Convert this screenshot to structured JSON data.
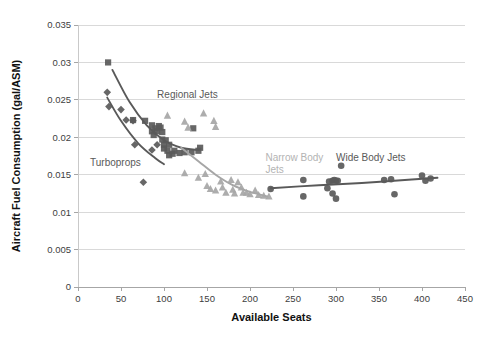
{
  "chart_data": {
    "type": "scatter",
    "title": "",
    "xlabel": "Available Seats",
    "ylabel": "Aircraft Fuel Consumption (gal/ASM)",
    "xlim": [
      0,
      450
    ],
    "ylim": [
      0,
      0.035
    ],
    "xticks": [
      "0",
      "50",
      "100",
      "150",
      "200",
      "250",
      "300",
      "350",
      "400",
      "450"
    ],
    "yticks": [
      "0",
      "0.005",
      "0.01",
      "0.015",
      "0.02",
      "0.025",
      "0.03",
      "0.035"
    ],
    "grid": "horizontal",
    "legend_position": "inline-annotations",
    "annotations": [
      {
        "text": "Regional Jets",
        "x": 92,
        "y": 0.0253,
        "color": "#595959"
      },
      {
        "text": "Turboprops",
        "x": 14,
        "y": 0.0161,
        "color": "#595959"
      },
      {
        "text": "Narrow Body",
        "x": 218,
        "y": 0.0168,
        "color": "#b3b3b3"
      },
      {
        "text": "Jets",
        "x": 218,
        "y": 0.0152,
        "color": "#b3b3b3"
      },
      {
        "text": "Wide Body Jets",
        "x": 300,
        "y": 0.0168,
        "color": "#595959"
      }
    ],
    "series": [
      {
        "name": "Turboprops",
        "marker": "diamond",
        "color": "#5a5a5a",
        "points": [
          [
            34,
            0.026
          ],
          [
            36,
            0.0241
          ],
          [
            50,
            0.0237
          ],
          [
            56,
            0.0223
          ],
          [
            64,
            0.0222
          ],
          [
            66,
            0.019
          ],
          [
            86,
            0.0183
          ],
          [
            92,
            0.019
          ],
          [
            76,
            0.014
          ]
        ],
        "trend": [
          [
            34,
            0.0253
          ],
          [
            50,
            0.0222
          ],
          [
            70,
            0.0192
          ],
          [
            90,
            0.0172
          ],
          [
            100,
            0.0164
          ]
        ]
      },
      {
        "name": "Regional Jets",
        "marker": "square",
        "color": "#5a5a5a",
        "points": [
          [
            35,
            0.03
          ],
          [
            64,
            0.0223
          ],
          [
            78,
            0.0222
          ],
          [
            86,
            0.0216
          ],
          [
            86,
            0.0208
          ],
          [
            88,
            0.0203
          ],
          [
            90,
            0.0212
          ],
          [
            92,
            0.0208
          ],
          [
            94,
            0.0215
          ],
          [
            96,
            0.0213
          ],
          [
            98,
            0.0207
          ],
          [
            98,
            0.0197
          ],
          [
            100,
            0.019
          ],
          [
            100,
            0.0185
          ],
          [
            102,
            0.0196
          ],
          [
            104,
            0.0182
          ],
          [
            106,
            0.019
          ],
          [
            106,
            0.0176
          ],
          [
            110,
            0.0178
          ],
          [
            112,
            0.0182
          ],
          [
            118,
            0.0179
          ],
          [
            124,
            0.018
          ],
          [
            132,
            0.018
          ],
          [
            134,
            0.0212
          ],
          [
            140,
            0.0182
          ],
          [
            142,
            0.0186
          ]
        ],
        "trend": [
          [
            40,
            0.029
          ],
          [
            60,
            0.0247
          ],
          [
            80,
            0.0216
          ],
          [
            100,
            0.0196
          ],
          [
            120,
            0.0186
          ],
          [
            140,
            0.0183
          ]
        ]
      },
      {
        "name": "Narrow Body Jets",
        "marker": "triangle",
        "color": "#a6a6a6",
        "points": [
          [
            104,
            0.0229
          ],
          [
            124,
            0.0221
          ],
          [
            128,
            0.0213
          ],
          [
            146,
            0.0232
          ],
          [
            158,
            0.0222
          ],
          [
            160,
            0.0214
          ],
          [
            124,
            0.0152
          ],
          [
            140,
            0.0146
          ],
          [
            148,
            0.0151
          ],
          [
            150,
            0.0135
          ],
          [
            154,
            0.0131
          ],
          [
            160,
            0.0129
          ],
          [
            166,
            0.0141
          ],
          [
            168,
            0.0133
          ],
          [
            172,
            0.0126
          ],
          [
            178,
            0.0143
          ],
          [
            180,
            0.013
          ],
          [
            182,
            0.0125
          ],
          [
            186,
            0.014
          ],
          [
            190,
            0.0133
          ],
          [
            192,
            0.0126
          ],
          [
            196,
            0.0126
          ],
          [
            200,
            0.0124
          ],
          [
            206,
            0.0129
          ],
          [
            210,
            0.0123
          ],
          [
            216,
            0.0122
          ],
          [
            222,
            0.0121
          ]
        ],
        "trend": [
          [
            120,
            0.0186
          ],
          [
            140,
            0.0168
          ],
          [
            160,
            0.015
          ],
          [
            180,
            0.0136
          ],
          [
            200,
            0.0127
          ],
          [
            220,
            0.0121
          ]
        ]
      },
      {
        "name": "Wide Body Jets",
        "marker": "circle",
        "color": "#5a5a5a",
        "points": [
          [
            224,
            0.0131
          ],
          [
            262,
            0.0143
          ],
          [
            262,
            0.0121
          ],
          [
            292,
            0.0141
          ],
          [
            296,
            0.0142
          ],
          [
            298,
            0.0143
          ],
          [
            300,
            0.0142
          ],
          [
            302,
            0.0142
          ],
          [
            290,
            0.0132
          ],
          [
            296,
            0.0125
          ],
          [
            300,
            0.0118
          ],
          [
            306,
            0.0162
          ],
          [
            356,
            0.0143
          ],
          [
            364,
            0.0144
          ],
          [
            368,
            0.0124
          ],
          [
            400,
            0.0149
          ],
          [
            404,
            0.0142
          ],
          [
            410,
            0.0145
          ]
        ],
        "trend": [
          [
            224,
            0.0132
          ],
          [
            280,
            0.0136
          ],
          [
            330,
            0.0139
          ],
          [
            380,
            0.0143
          ],
          [
            418,
            0.0146
          ]
        ]
      }
    ]
  },
  "axes": {
    "x_title": "Available Seats",
    "y_title": "Aircraft Fuel Consumption (gal/ASM)"
  }
}
